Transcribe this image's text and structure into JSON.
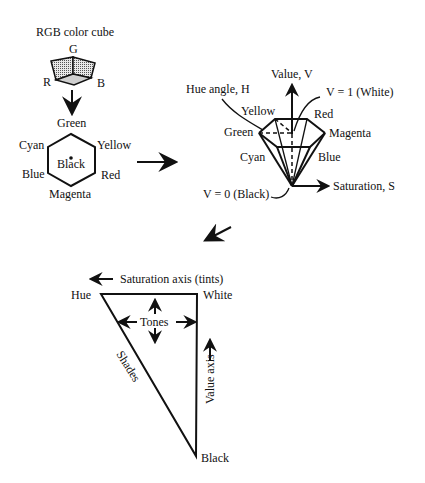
{
  "rgb_cube": {
    "title": "RGB color cube",
    "labels": {
      "g": "G",
      "r": "R",
      "b": "B"
    }
  },
  "hexagon": {
    "labels": {
      "top": "Green",
      "upper_left": "Cyan",
      "upper_right": "Yellow",
      "center": "Black",
      "lower_left": "Blue",
      "lower_right": "Red",
      "bottom": "Magenta"
    }
  },
  "hexcone": {
    "labels": {
      "value_axis": "Value, V",
      "hue_angle": "Hue angle, H",
      "v_white": "V = 1 (White)",
      "yellow": "Yellow",
      "red": "Red",
      "green": "Green",
      "magenta": "Magenta",
      "cyan": "Cyan",
      "blue": "Blue",
      "v_black": "V = 0 (Black)",
      "saturation_axis": "Saturation, S"
    }
  },
  "triangle": {
    "labels": {
      "saturation_axis": "Saturation axis (tints)",
      "hue": "Hue",
      "white": "White",
      "tones": "Tones",
      "shades": "Shades",
      "value_axis": "Value axis",
      "black": "Black"
    }
  },
  "colors": {
    "ink": "#111111",
    "background": "#ffffff",
    "cube_fill": "#bdbdbd"
  }
}
